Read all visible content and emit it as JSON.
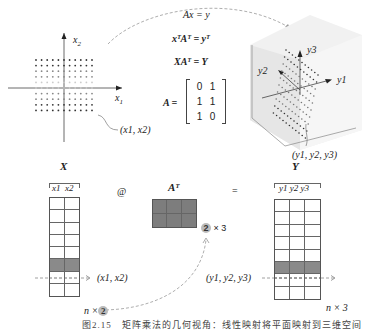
{
  "top": {
    "plane": {
      "x1_label": "x",
      "x1_sub": "1",
      "x2_label": "x",
      "x2_sub": "2",
      "point_label": "(x1, x2)"
    },
    "equations": {
      "eq1": "Ax = y",
      "eq2": "xᵀAᵀ = yᵀ",
      "eq3": "XAᵀ = Y",
      "matrix_name": "A =",
      "matrix_rows": [
        [
          "0",
          "1"
        ],
        [
          "1",
          "1"
        ],
        [
          "1",
          "0"
        ]
      ]
    },
    "cube": {
      "y1_label": "y1",
      "y2_label": "y2",
      "y3_label": "y3",
      "point_label": "(y1, y2, y3)"
    }
  },
  "bottom": {
    "X": {
      "title": "X",
      "cols": [
        "x1",
        "x2"
      ],
      "rows": 8,
      "highlight_row": 5,
      "row_label": "(x1, x2)",
      "dim_n": "n ×",
      "dim_k": "2"
    },
    "operator_at": "@",
    "At": {
      "title": "Aᵀ",
      "rows": 2,
      "cols": 3,
      "dim_k": "2",
      "dim_rest": "× 3"
    },
    "operator_eq": "=",
    "Y": {
      "title": "Y",
      "cols": [
        "y1",
        "y2",
        "y3"
      ],
      "rows": 8,
      "highlight_row": 5,
      "row_label": "(y1, y2, y3)",
      "dim": "n × 3"
    }
  },
  "caption": "图2.15　矩阵乘法的几何视角：线性映射将平面映射到三维空间"
}
